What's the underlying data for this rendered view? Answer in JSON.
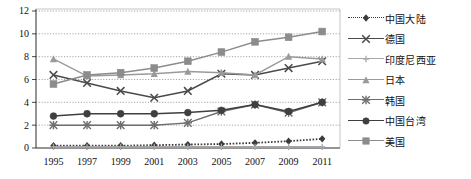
{
  "chart_data": {
    "type": "line",
    "title": "",
    "xlabel": "",
    "ylabel": "",
    "grid": true,
    "legend_position": "right",
    "categories": [
      "1995",
      "1997",
      "1999",
      "2001",
      "2003",
      "2005",
      "2007",
      "2009",
      "2011"
    ],
    "x_tick_labels": [
      "1995",
      "1997",
      "1999",
      "2001",
      "2003",
      "2005",
      "2007",
      "2009",
      "2011"
    ],
    "y_tick_labels": [
      "0",
      "2",
      "4",
      "6",
      "8",
      "10",
      "12"
    ],
    "ylim": [
      0,
      12
    ],
    "y_ticks": [
      0,
      2,
      4,
      6,
      8,
      10,
      12
    ],
    "series": [
      {
        "name": "中国大陆",
        "marker": "diamond",
        "line_style": "dotted",
        "color": "#3b3b3b",
        "values": [
          0.2,
          0.2,
          0.2,
          0.25,
          0.3,
          0.35,
          0.45,
          0.6,
          0.8
        ]
      },
      {
        "name": "德国",
        "marker": "x",
        "line_style": "solid",
        "color": "#4a4a4a",
        "values": [
          6.4,
          5.7,
          5.0,
          4.4,
          5.0,
          6.5,
          6.4,
          7.0,
          7.6
        ]
      },
      {
        "name": "印度尼西亚",
        "marker": "plus",
        "line_style": "solid",
        "color": "#a8a8a8",
        "values": [
          0.1,
          0.1,
          0.1,
          0.1,
          0.1,
          0.1,
          0.1,
          0.1,
          0.1
        ]
      },
      {
        "name": "日本",
        "marker": "triangle",
        "line_style": "solid",
        "color": "#9a9a9a",
        "values": [
          7.8,
          6.3,
          6.4,
          6.5,
          6.7,
          6.6,
          6.4,
          8.0,
          7.8
        ]
      },
      {
        "name": "韩国",
        "marker": "star",
        "line_style": "solid",
        "color": "#6e6e6e",
        "values": [
          2.0,
          2.0,
          2.0,
          2.0,
          2.2,
          3.2,
          3.8,
          3.1,
          4.0
        ]
      },
      {
        "name": "中国台湾",
        "marker": "circle",
        "line_style": "solid",
        "color": "#3f3f3f",
        "values": [
          2.8,
          3.0,
          3.0,
          3.0,
          3.1,
          3.3,
          3.8,
          3.2,
          4.0
        ]
      },
      {
        "name": "美国",
        "marker": "square",
        "line_style": "solid",
        "color": "#8c8c8c",
        "values": [
          5.6,
          6.4,
          6.6,
          7.0,
          7.6,
          8.4,
          9.3,
          9.7,
          10.2
        ]
      }
    ]
  },
  "legend": {
    "items": [
      {
        "label": "中国大陆"
      },
      {
        "label": "德国"
      },
      {
        "label": "印度尼西亚"
      },
      {
        "label": "日本"
      },
      {
        "label": "韩国"
      },
      {
        "label": "中国台湾"
      },
      {
        "label": "美国"
      }
    ]
  }
}
